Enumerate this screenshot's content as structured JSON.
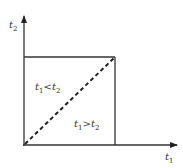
{
  "diagram": {
    "axes": {
      "x_label": {
        "var": "t",
        "sub": "1"
      },
      "y_label": {
        "var": "t",
        "sub": "2"
      }
    },
    "regions": [
      {
        "name": "upper-left",
        "var1": "t",
        "sub1": "1",
        "op": "<",
        "var2": "t",
        "sub2": "2"
      },
      {
        "name": "lower-right",
        "var1": "t",
        "sub1": "1",
        "op": ">",
        "var2": "t",
        "sub2": "2"
      }
    ],
    "colors": {
      "line": "#333333",
      "background": "#ffffff"
    }
  }
}
